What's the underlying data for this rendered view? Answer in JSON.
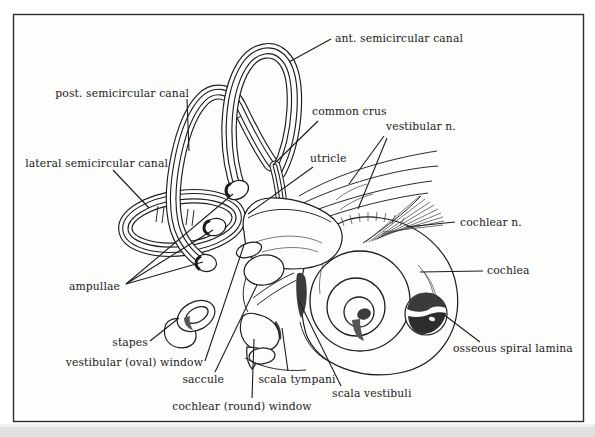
{
  "figure": {
    "type": "anatomical line-art diagram of the inner ear (bony labyrinth)",
    "colors": {
      "paper": "#ffffff",
      "ink": "#1d1d1d",
      "shade_dark": "#3b3b3b",
      "shade_mid": "#555555",
      "frame": "#2e2e2e",
      "scan_shadow": "#c9c9c9"
    },
    "labels": {
      "ant_semicircular_canal": "ant. semicircular canal",
      "post_semicircular_canal": "post. semicircular canal",
      "common_crus": "common crus",
      "vestibular_n": "vestibular n.",
      "lateral_semicircular_canal": "lateral semicircular canal",
      "utricle": "utricle",
      "cochlear_n": "cochlear n.",
      "cochlea": "cochlea",
      "ampullae": "ampullae",
      "stapes": "stapes",
      "vestibular_oval_window": "vestibular (oval) window",
      "saccule": "saccule",
      "scala_tympani": "scala tympani",
      "scala_vestibuli": "scala vestibuli",
      "cochlear_round_window": "cochlear (round) window",
      "osseous_spiral_lamina": "osseous spiral lamina"
    }
  }
}
